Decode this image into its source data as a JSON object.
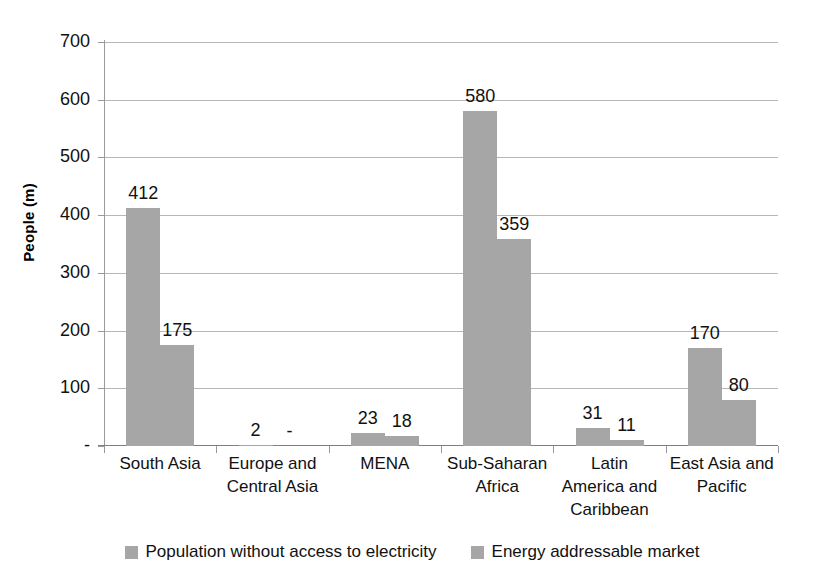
{
  "chart_data": {
    "type": "bar",
    "title": "",
    "subtitle": "",
    "xlabel": "",
    "ylabel": "People (m)",
    "ylim": [
      0,
      700
    ],
    "y_ticks": [
      "-",
      "100",
      "200",
      "300",
      "400",
      "500",
      "600",
      "700"
    ],
    "y_tick_values": [
      0,
      100,
      200,
      300,
      400,
      500,
      600,
      700
    ],
    "grid": true,
    "legend_position": "bottom",
    "categories": [
      "South Asia",
      "Europe and Central Asia",
      "MENA",
      "Sub-Saharan Africa",
      "Latin America and Caribbean",
      "East Asia and Pacific"
    ],
    "series": [
      {
        "name": "Population without access to electricity",
        "color": "#a6a6a6",
        "values": [
          412,
          2,
          23,
          580,
          31,
          170
        ],
        "labels": [
          "412",
          "2",
          "23",
          "580",
          "31",
          "170"
        ]
      },
      {
        "name": "Energy addressable market",
        "color": "#a6a6a6",
        "values": [
          175,
          0,
          18,
          359,
          11,
          80
        ],
        "labels": [
          "175",
          "-",
          "18",
          "359",
          "11",
          "80"
        ]
      }
    ]
  },
  "axis": {
    "y_title": "People (m)",
    "y_tick_labels": [
      "700",
      "600",
      "500",
      "400",
      "300",
      "200",
      "100",
      "-"
    ],
    "x_category_lines": [
      [
        "South Asia"
      ],
      [
        "Europe and",
        "Central Asia"
      ],
      [
        "MENA"
      ],
      [
        "Sub-Saharan",
        "Africa"
      ],
      [
        "Latin",
        "America and",
        "Caribbean"
      ],
      [
        "East Asia and",
        "Pacific"
      ]
    ]
  },
  "legend": {
    "items": [
      {
        "label": "Population without access to electricity",
        "color": "#a6a6a6",
        "swatch": "square-swatch"
      },
      {
        "label": "Energy addressable market",
        "color": "#a6a6a6",
        "swatch": "square-swatch"
      }
    ]
  },
  "bar_labels": {
    "s1": [
      "412",
      "2",
      "23",
      "580",
      "31",
      "170"
    ],
    "s2": [
      "175",
      "-",
      "18",
      "359",
      "11",
      "80"
    ]
  }
}
